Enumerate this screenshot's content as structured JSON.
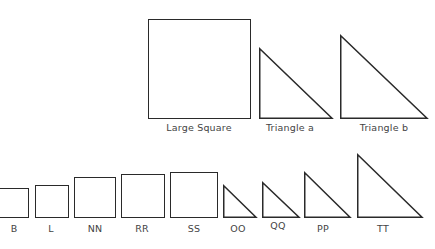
{
  "diagram": {
    "stroke_color": "#2a2a2a",
    "top_row": {
      "large_square": {
        "label": "Large Square"
      },
      "triangle_a": {
        "label": "Triangle a"
      },
      "triangle_b": {
        "label": "Triangle b"
      }
    },
    "bottom_row": {
      "squares": [
        {
          "label": "B"
        },
        {
          "label": "L"
        },
        {
          "label": "NN"
        },
        {
          "label": "RR"
        },
        {
          "label": "SS"
        }
      ],
      "triangles": [
        {
          "label": "OO"
        },
        {
          "label": "QQ"
        },
        {
          "label": "PP"
        },
        {
          "label": "TT"
        }
      ]
    }
  }
}
